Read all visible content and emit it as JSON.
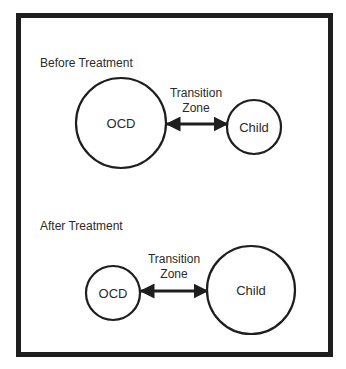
{
  "colors": {
    "stroke": "#1e1e1e",
    "text": "#2a2a2a",
    "background": "#ffffff"
  },
  "before": {
    "title": "Before Treatment",
    "ocd": {
      "label": "OCD",
      "cx": 121,
      "cy": 123,
      "r": 45
    },
    "child": {
      "label": "Child",
      "cx": 254,
      "cy": 127,
      "r": 27
    },
    "transition": {
      "line1": "Transition",
      "line2": "Zone",
      "x1": 166,
      "x2": 227,
      "y": 124
    }
  },
  "after": {
    "title": "After Treatment",
    "ocd": {
      "label": "OCD",
      "cx": 113,
      "cy": 293,
      "r": 27
    },
    "child": {
      "label": "Child",
      "cx": 251,
      "cy": 290,
      "r": 44
    },
    "transition": {
      "line1": "Transition",
      "line2": "Zone",
      "x1": 140,
      "x2": 207,
      "y": 291
    }
  }
}
